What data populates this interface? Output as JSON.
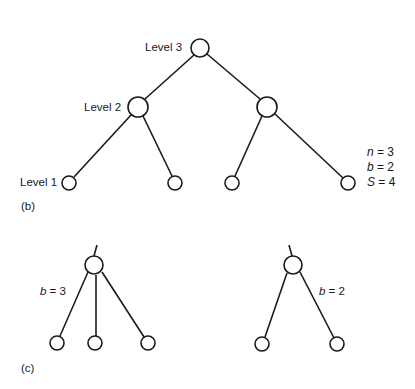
{
  "figure_b": {
    "panel_label": "(b)",
    "levels": [
      "Level 3",
      "Level 2",
      "Level 1"
    ],
    "params": {
      "n": {
        "var": "n",
        "eq": " = 3"
      },
      "b": {
        "var": "b",
        "eq": " = 2"
      },
      "S": {
        "var": "S",
        "eq": " = 4"
      }
    },
    "nodes": [
      {
        "id": "root",
        "level": 3,
        "cx": 200,
        "cy": 48,
        "r": 9
      },
      {
        "id": "l2a",
        "level": 2,
        "cx": 138,
        "cy": 107,
        "r": 10
      },
      {
        "id": "l2b",
        "level": 2,
        "cx": 267,
        "cy": 107,
        "r": 10
      },
      {
        "id": "l1a",
        "level": 1,
        "cx": 69,
        "cy": 183,
        "r": 7
      },
      {
        "id": "l1b",
        "level": 1,
        "cx": 175,
        "cy": 183,
        "r": 7
      },
      {
        "id": "l1c",
        "level": 1,
        "cx": 232,
        "cy": 183,
        "r": 7
      },
      {
        "id": "l1d",
        "level": 1,
        "cx": 348,
        "cy": 183,
        "r": 7
      }
    ],
    "edges": [
      [
        "root",
        "l2a"
      ],
      [
        "root",
        "l2b"
      ],
      [
        "l2a",
        "l1a"
      ],
      [
        "l2a",
        "l1b"
      ],
      [
        "l2b",
        "l1c"
      ],
      [
        "l2b",
        "l1d"
      ]
    ]
  },
  "figure_c": {
    "panel_label": "(c)",
    "left_tree": {
      "var": "b",
      "eq": " = 3",
      "branches": 3
    },
    "right_tree": {
      "var": "b",
      "eq": " = 2",
      "branches": 2
    }
  }
}
